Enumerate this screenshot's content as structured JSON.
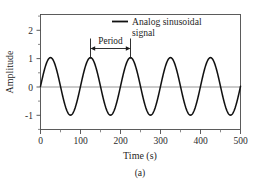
{
  "figure": {
    "caption": "(a)"
  },
  "chart_data": {
    "type": "line",
    "title": "",
    "subtitle": "",
    "xlabel": "Time (s)",
    "ylabel": "Amplitude",
    "xlim": [
      0,
      500
    ],
    "ylim": [
      -1.5,
      2.5
    ],
    "grid": false,
    "legend_position": "top-right",
    "series": [
      {
        "name": "Analog sinusoidal signal",
        "color": "#111111",
        "waveform": "sine",
        "amplitude": 1,
        "period": 100,
        "phase": 0,
        "offset": 0,
        "x": [
          0,
          25,
          50,
          75,
          100,
          125,
          150,
          175,
          200,
          225,
          250,
          275,
          300,
          325,
          350,
          375,
          400,
          425,
          450,
          475,
          500
        ],
        "values": [
          0,
          1,
          0,
          -1,
          0,
          1,
          0,
          -1,
          0,
          1,
          0,
          -1,
          0,
          1,
          0,
          -1,
          0,
          1,
          0,
          -1,
          0
        ]
      }
    ],
    "xticks": [
      0,
      100,
      200,
      300,
      400,
      500
    ],
    "xtick_labels": [
      "0",
      "100",
      "200",
      "300",
      "400",
      "500"
    ],
    "xticks_minor": [
      50,
      150,
      250,
      350,
      450
    ],
    "yticks": [
      2,
      1,
      0,
      -1
    ],
    "ytick_labels": [
      "2",
      "1",
      "0",
      "-1"
    ],
    "yticks_minor": [
      2.5,
      1.5,
      0.5,
      -0.5,
      -1.5
    ],
    "annotations": [
      {
        "label": "Period",
        "type": "double-arrow-span",
        "x_start": 125,
        "x_end": 225,
        "y": 1.55
      }
    ],
    "legend": [
      {
        "line1": "Analog sinusoidal",
        "line2": "signal",
        "marker": "line",
        "color": "#111111"
      }
    ]
  },
  "labels": {
    "y_axis_title": "Amplitude",
    "x_axis_title": "Time (s)",
    "period_label": "Period",
    "legend_line_1": "Analog sinusoidal",
    "legend_line_2": "signal",
    "ytick_2": "2",
    "ytick_1": "1",
    "ytick_0": "0",
    "ytick_m1": "-1",
    "xtick_0": "0",
    "xtick_100": "100",
    "xtick_200": "200",
    "xtick_300": "300",
    "xtick_400": "400",
    "xtick_500": "500",
    "caption": "(a)"
  },
  "colors": {
    "wave": "#111111",
    "axis": "#4a4a4a",
    "zero_line": "#8a8a8a",
    "background": "#ffffff"
  }
}
